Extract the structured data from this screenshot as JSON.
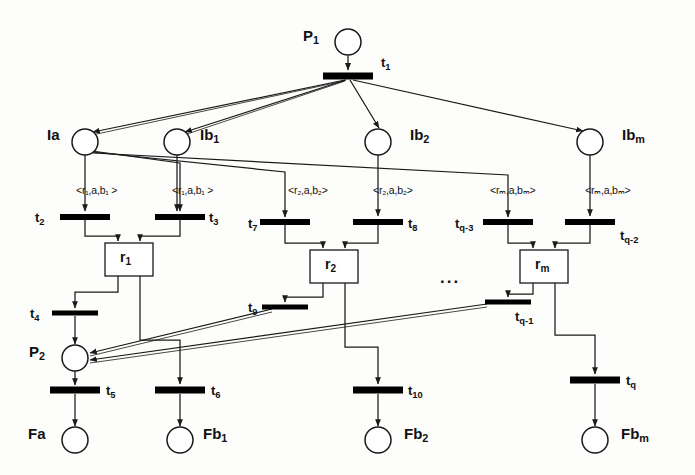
{
  "diagram": {
    "type": "petri-net",
    "colors": {
      "stroke": "#1a1a1a",
      "transition_fill": "#000000",
      "place_fill": "#ffffff",
      "background": "#fdfdfb"
    }
  },
  "places": [
    {
      "id": "P1",
      "label": "P",
      "sub": "1",
      "cx": 348,
      "cy": 42,
      "r": 13,
      "label_x": 303,
      "label_y": 27
    },
    {
      "id": "Ia",
      "label": "Ia",
      "sub": "",
      "cx": 85,
      "cy": 142,
      "r": 13,
      "label_x": 47,
      "label_y": 126
    },
    {
      "id": "Ib1",
      "label": "Ib",
      "sub": "1",
      "cx": 177,
      "cy": 142,
      "r": 13,
      "label_x": 200,
      "label_y": 126
    },
    {
      "id": "Ib2",
      "label": "Ib",
      "sub": "2",
      "cx": 378,
      "cy": 142,
      "r": 13,
      "label_x": 410,
      "label_y": 126
    },
    {
      "id": "Ibm",
      "label": "Ib",
      "sub": "m",
      "cx": 590,
      "cy": 142,
      "r": 13,
      "label_x": 622,
      "label_y": 126
    },
    {
      "id": "P2",
      "label": "P",
      "sub": "2",
      "cx": 75,
      "cy": 358,
      "r": 13,
      "label_x": 29,
      "label_y": 343
    },
    {
      "id": "Fa",
      "label": "Fa",
      "sub": "",
      "cx": 75,
      "cy": 440,
      "r": 13,
      "label_x": 28,
      "label_y": 425
    },
    {
      "id": "Fb1",
      "label": "Fb",
      "sub": "1",
      "cx": 180,
      "cy": 440,
      "r": 13,
      "label_x": 203,
      "label_y": 425
    },
    {
      "id": "Fb2",
      "label": "Fb",
      "sub": "2",
      "cx": 378,
      "cy": 440,
      "r": 13,
      "label_x": 404,
      "label_y": 425
    },
    {
      "id": "Fbm",
      "label": "Fb",
      "sub": "m",
      "cx": 595,
      "cy": 440,
      "r": 13,
      "label_x": 621,
      "label_y": 425
    }
  ],
  "transitions": [
    {
      "id": "t1",
      "label": "t",
      "sub": "1",
      "cx": 348,
      "cy": 76,
      "w": 50,
      "h": 7,
      "label_x": 381,
      "label_y": 55
    },
    {
      "id": "t2",
      "label": "t",
      "sub": "2",
      "cx": 85,
      "cy": 217,
      "w": 50,
      "h": 6,
      "label_x": 35,
      "label_y": 210
    },
    {
      "id": "t3",
      "label": "t",
      "sub": "3",
      "cx": 180,
      "cy": 217,
      "w": 50,
      "h": 6,
      "label_x": 209,
      "label_y": 210
    },
    {
      "id": "t7",
      "label": "t",
      "sub": "7",
      "cx": 285,
      "cy": 222,
      "w": 50,
      "h": 6,
      "label_x": 248,
      "label_y": 216
    },
    {
      "id": "t8",
      "label": "t",
      "sub": "8",
      "cx": 378,
      "cy": 222,
      "w": 50,
      "h": 6,
      "label_x": 408,
      "label_y": 216
    },
    {
      "id": "tq3",
      "label": "t",
      "sub": "q-3",
      "cx": 508,
      "cy": 222,
      "w": 50,
      "h": 6,
      "label_x": 455,
      "label_y": 216
    },
    {
      "id": "tq2",
      "label": "t",
      "sub": "q-2",
      "cx": 590,
      "cy": 222,
      "w": 50,
      "h": 6,
      "label_x": 620,
      "label_y": 228
    },
    {
      "id": "t4",
      "label": "t",
      "sub": "4",
      "cx": 75,
      "cy": 313,
      "w": 46,
      "h": 5,
      "label_x": 30,
      "label_y": 306
    },
    {
      "id": "t9",
      "label": "t",
      "sub": "9",
      "cx": 285,
      "cy": 307,
      "w": 46,
      "h": 5,
      "label_x": 248,
      "label_y": 300
    },
    {
      "id": "tq1",
      "label": "t",
      "sub": "q-1",
      "cx": 508,
      "cy": 302,
      "w": 46,
      "h": 5,
      "label_x": 515,
      "label_y": 309
    },
    {
      "id": "t5",
      "label": "t",
      "sub": "5",
      "cx": 75,
      "cy": 390,
      "w": 50,
      "h": 7,
      "label_x": 106,
      "label_y": 383
    },
    {
      "id": "t6",
      "label": "t",
      "sub": "6",
      "cx": 180,
      "cy": 390,
      "w": 50,
      "h": 7,
      "label_x": 211,
      "label_y": 383
    },
    {
      "id": "t10",
      "label": "t",
      "sub": "10",
      "cx": 378,
      "cy": 390,
      "w": 50,
      "h": 7,
      "label_x": 408,
      "label_y": 383
    },
    {
      "id": "tq",
      "label": "t",
      "sub": "q",
      "cx": 595,
      "cy": 380,
      "w": 50,
      "h": 7,
      "label_x": 626,
      "label_y": 373
    }
  ],
  "resources": [
    {
      "id": "r1",
      "label": "r",
      "sub": "1",
      "x": 105,
      "y": 243,
      "w": 48,
      "h": 33,
      "label_x": 120,
      "label_y": 249
    },
    {
      "id": "r2",
      "label": "r",
      "sub": "2",
      "x": 310,
      "y": 250,
      "w": 48,
      "h": 33,
      "label_x": 325,
      "label_y": 256
    },
    {
      "id": "rm",
      "label": "r",
      "sub": "m",
      "x": 520,
      "y": 250,
      "w": 48,
      "h": 33,
      "label_x": 535,
      "label_y": 256
    }
  ],
  "arc_labels": [
    {
      "id": "arc-r1-a-b1-left",
      "text": "<r₁,a,b₁ >",
      "x": 76,
      "y": 184
    },
    {
      "id": "arc-r1-a-b1-right",
      "text": "<r₁,a,b₁ >",
      "x": 172,
      "y": 184
    },
    {
      "id": "arc-r2-a-b2-left",
      "text": "<r₂,a,b₂>",
      "x": 288,
      "y": 184
    },
    {
      "id": "arc-r2-a-b2-right",
      "text": "<r₂,a,b₂>",
      "x": 373,
      "y": 184
    },
    {
      "id": "arc-rm-a-bm-left",
      "text": "<rₘ,a,bₘ>",
      "x": 490,
      "y": 184
    },
    {
      "id": "arc-rm-a-bm-right",
      "text": "<rₘ,a,bₘ>",
      "x": 585,
      "y": 184
    }
  ],
  "ellipses": [
    {
      "id": "ellipsis-middle",
      "text": "...",
      "x": 440,
      "y": 268
    }
  ]
}
